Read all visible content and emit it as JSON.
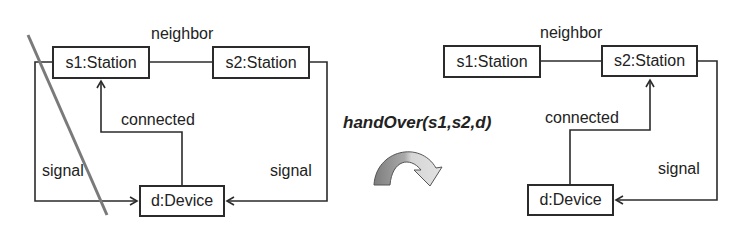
{
  "operation": {
    "label": "handOver(s1,s2,d)"
  },
  "before": {
    "nodes": {
      "s1": "s1:Station",
      "s2": "s2:Station",
      "d": "d:Device"
    },
    "edges": {
      "neighbor": "neighbor",
      "connected": "connected",
      "signal_left": "signal",
      "signal_right": "signal"
    },
    "struck_edge": "signal (s1 -> d)"
  },
  "after": {
    "nodes": {
      "s1": "s1:Station",
      "s2": "s2:Station",
      "d": "d:Device"
    },
    "edges": {
      "neighbor": "neighbor",
      "connected": "connected",
      "signal": "signal"
    }
  },
  "colors": {
    "line": "#2b2b2b",
    "strike": "#7a7a7a",
    "arrow_dark": "#8a8a8a",
    "arrow_light": "#cfcfcf"
  }
}
